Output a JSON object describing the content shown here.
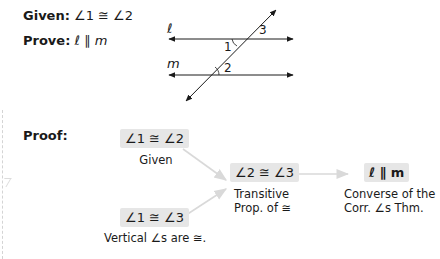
{
  "given": {
    "label": "Given:",
    "statement": "∠1 ≅ ∠2"
  },
  "prove": {
    "label": "Prove:",
    "statement": "ℓ ∥ m"
  },
  "figure": {
    "line_labels": [
      "ℓ",
      "m"
    ],
    "angle_labels": [
      "1",
      "2",
      "3"
    ]
  },
  "proof": {
    "label": "Proof:",
    "nodes": [
      {
        "statement": "∠1 ≅ ∠2",
        "reason": "Given"
      },
      {
        "statement": "∠1 ≅ ∠3",
        "reason": "Vertical ∠s are ≅."
      },
      {
        "statement": "∠2 ≅ ∠3",
        "reason_line1": "Transitive",
        "reason_line2": "Prop. of ≅"
      },
      {
        "statement": "ℓ ∥ m",
        "reason_line1": "Converse of the",
        "reason_line2": "Corr. ∠s Thm."
      }
    ]
  },
  "colors": {
    "box_fill": "#e6e6e6",
    "arrow": "#d9d9d9",
    "text": "#1a1a1a"
  }
}
